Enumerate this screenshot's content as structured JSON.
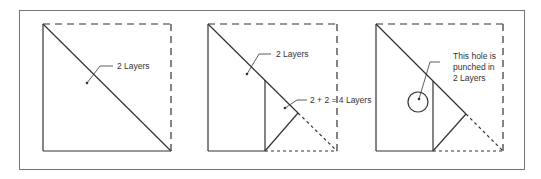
{
  "figure": {
    "panels": [
      {
        "id": "panel-1",
        "labels": [
          "2 Layers"
        ]
      },
      {
        "id": "panel-2",
        "labels": [
          "2 Layers",
          "2 + 2 = 4 Layers"
        ]
      },
      {
        "id": "panel-3",
        "labels": [
          "This hole is",
          "punched in",
          "2 Layers"
        ]
      }
    ],
    "colors": {
      "stroke": "#333333",
      "frame": "#777777",
      "background": "#ffffff"
    }
  }
}
